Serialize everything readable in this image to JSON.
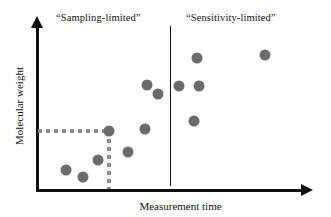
{
  "chart_data": {
    "type": "scatter",
    "title": "",
    "xlabel": "Measurement time",
    "ylabel": "Molecular weight",
    "xlim": [
      0,
      100
    ],
    "ylim": [
      0,
      100
    ],
    "grid": false,
    "legend": "none",
    "marker_color": "#6b6b6b",
    "axis_color": "#111111",
    "guide_color": "#8a8a8a",
    "annotations": [
      {
        "name": "region-label-left",
        "text": "“Sampling-limited”",
        "x": 22,
        "y": 97
      },
      {
        "name": "region-label-right",
        "text": "“Sensitivity-limited”",
        "x": 70,
        "y": 97
      }
    ],
    "divider": {
      "name": "regime-divider",
      "orientation": "vertical",
      "x": 50.7,
      "y_from": 2,
      "y_to": 100
    },
    "guides": [
      {
        "name": "threshold-horizontal",
        "orientation": "horizontal",
        "y": 35.8,
        "x_from": 0,
        "x_to": 27.2
      },
      {
        "name": "threshold-vertical",
        "orientation": "vertical",
        "x": 27.2,
        "y_from": 0,
        "y_to": 35.8
      }
    ],
    "points": [
      {
        "id": "p1",
        "x": 10.8,
        "y": 11.6,
        "r": 5.5,
        "regime": "sampling-limited"
      },
      {
        "id": "p2",
        "x": 17.2,
        "y": 7.3,
        "r": 5.5,
        "regime": "sampling-limited"
      },
      {
        "id": "p3",
        "x": 23.1,
        "y": 17.7,
        "r": 5.5,
        "regime": "sampling-limited"
      },
      {
        "id": "p4",
        "x": 27.2,
        "y": 35.8,
        "r": 5.5,
        "regime": "sampling-limited"
      },
      {
        "id": "p5",
        "x": 34.4,
        "y": 22.6,
        "r": 5.5,
        "regime": "sampling-limited"
      },
      {
        "id": "p6",
        "x": 41.0,
        "y": 36.6,
        "r": 5.5,
        "regime": "sampling-limited"
      },
      {
        "id": "p7",
        "x": 41.8,
        "y": 64.0,
        "r": 5.5,
        "regime": "sampling-limited"
      },
      {
        "id": "p8",
        "x": 46.0,
        "y": 58.5,
        "r": 5.5,
        "regime": "sampling-limited"
      },
      {
        "id": "p9",
        "x": 53.8,
        "y": 63.4,
        "r": 5.5,
        "regime": "sensitivity-limited"
      },
      {
        "id": "p10",
        "x": 60.9,
        "y": 80.5,
        "r": 5.5,
        "regime": "sensitivity-limited"
      },
      {
        "id": "p11",
        "x": 61.7,
        "y": 63.4,
        "r": 5.5,
        "regime": "sensitivity-limited"
      },
      {
        "id": "p12",
        "x": 59.8,
        "y": 41.5,
        "r": 5.5,
        "regime": "sensitivity-limited"
      },
      {
        "id": "p13",
        "x": 86.5,
        "y": 82.3,
        "r": 5.5,
        "regime": "sensitivity-limited"
      }
    ]
  }
}
